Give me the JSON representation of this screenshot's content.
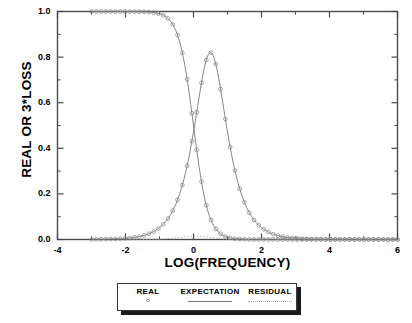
{
  "chart_data": {
    "type": "line",
    "title": "",
    "xlabel": "LOG(FREQUENCY)",
    "ylabel": "REAL OR 3*LOSS",
    "xlim": [
      -4,
      6
    ],
    "ylim": [
      0.0,
      1.0
    ],
    "xticks": [
      -4,
      -2,
      0,
      2,
      4,
      6
    ],
    "xtick_labels": [
      "-4",
      "-2",
      "0",
      "2",
      "4",
      "6"
    ],
    "yticks": [
      0.0,
      0.2,
      0.4,
      0.6,
      0.8,
      1.0
    ],
    "ytick_labels": [
      "0.0",
      "0.2",
      "0.4",
      "0.6",
      "0.8",
      "1.0"
    ],
    "x_minor_interval": 1,
    "y_minor_interval": 0.1,
    "grid": false,
    "legend_position": "below-axes",
    "series": [
      {
        "name": "REAL",
        "style": "open-circle-markers",
        "color": "#8a8a8a",
        "x": [
          -3.0,
          -2.8,
          -2.6,
          -2.4,
          -2.2,
          -2.0,
          -1.8,
          -1.6,
          -1.4,
          -1.2,
          -1.0,
          -0.8,
          -0.6,
          -0.4,
          -0.2,
          0.0,
          0.2,
          0.4,
          0.6,
          0.8,
          1.0,
          1.2,
          1.4,
          1.6,
          1.8,
          2.0,
          2.2,
          2.4,
          2.6,
          2.8,
          3.0,
          3.2,
          3.4,
          3.6,
          3.8,
          4.0,
          4.2,
          4.4,
          4.6,
          4.8,
          5.0,
          5.2,
          5.4,
          5.6,
          5.8,
          6.0
        ],
        "y_real": [
          0.999,
          0.998,
          0.997,
          0.995,
          0.992,
          0.99,
          0.984,
          0.975,
          0.961,
          0.939,
          0.909,
          0.863,
          0.799,
          0.714,
          0.613,
          0.5,
          0.387,
          0.286,
          0.201,
          0.137,
          0.091,
          0.059,
          0.038,
          0.025,
          0.016,
          0.01,
          0.0063,
          0.004,
          0.0025,
          0.0016,
          0.001,
          0.00063,
          0.0004,
          0.00025,
          0.00016,
          0.0001,
          6e-05,
          4e-05,
          2.5e-05,
          1.6e-05,
          1e-05,
          6e-06,
          4e-06,
          2.5e-06,
          1.6e-06,
          1e-06
        ],
        "y_loss3": [
          0.0095,
          0.015,
          0.024,
          0.038,
          0.06,
          0.094,
          0.147,
          0.227,
          0.344,
          0.5,
          0.683,
          0.855,
          0.96,
          0.99,
          0.93,
          0.82,
          0.72,
          0.63,
          0.55,
          0.47,
          0.39,
          0.32,
          0.26,
          0.2,
          0.15,
          0.12,
          0.09,
          0.07,
          0.055,
          0.04,
          0.03,
          0.024,
          0.019,
          0.015,
          0.012,
          0.0095,
          0.0075,
          0.006,
          0.0047,
          0.0038,
          0.003,
          0.0024,
          0.0019,
          0.0015,
          0.0012,
          0.00095
        ]
      },
      {
        "name": "EXPECTATION",
        "style": "solid-line",
        "color": "#777777"
      },
      {
        "name": "RESIDUAL",
        "style": "dotted-line",
        "color": "#aaaaaa"
      }
    ],
    "notes": {
      "real_curve": "Debye real part descending sigmoid from 1.0 to 0.0, half-value at log(f)=0",
      "loss_curve": "3x Debye loss peak, maximum about 0.82 near log(f)=0.5",
      "curve_crossing": "curves cross at about y=0.77 near log(f)=0.25",
      "residual_curve": "near-zero dotted trace along baseline"
    }
  },
  "legend": {
    "entries": [
      {
        "label": "REAL",
        "symbol": "open-circle"
      },
      {
        "label": "EXPECTATION",
        "symbol": "solid-line"
      },
      {
        "label": "RESIDUAL",
        "symbol": "dotted-line"
      }
    ]
  },
  "colors": {
    "frame": "#4a4a4a",
    "marker": "#8a8a8a",
    "expectation": "#777777",
    "residual": "#b0b0b0",
    "text": "#000000",
    "legend_shadow": "#1a1a1a"
  }
}
